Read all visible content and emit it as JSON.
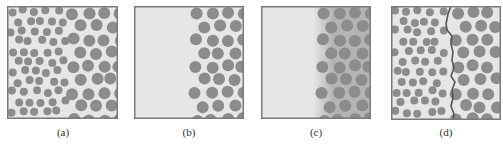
{
  "figure": {
    "colors": {
      "background": "#e6e6e6",
      "particle": "#8c8c8c",
      "frame": "#7a7a7a",
      "gradient_zone": "#b4b4b4",
      "boundary": "#555555"
    },
    "panels": [
      {
        "id": "a",
        "label": "(a)",
        "x": 7,
        "y": 6,
        "w": 111,
        "h": 113,
        "label_x": 63,
        "label_y": 126
      },
      {
        "id": "b",
        "label": "(b)",
        "x": 134,
        "y": 6,
        "w": 110,
        "h": 113,
        "label_x": 189,
        "label_y": 126
      },
      {
        "id": "c",
        "label": "(c)",
        "x": 261,
        "y": 6,
        "w": 110,
        "h": 113,
        "label_x": 316,
        "label_y": 126
      },
      {
        "id": "d",
        "label": "(d)",
        "x": 391,
        "y": 6,
        "w": 110,
        "h": 114,
        "label_x": 446,
        "label_y": 126
      }
    ]
  }
}
